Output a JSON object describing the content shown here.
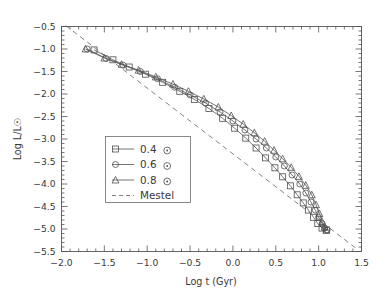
{
  "chart_data": {
    "type": "line",
    "title": "",
    "xlabel": "Log t (Gyr)",
    "ylabel": "Log L/L☉",
    "xlim": [
      -2.0,
      1.5
    ],
    "ylim": [
      -5.5,
      -0.5
    ],
    "xticks": [
      -2.0,
      -1.5,
      -1.0,
      -0.5,
      0.0,
      0.5,
      1.0,
      1.5
    ],
    "xtick_labels": [
      "-2.0",
      "-1.5",
      "-1.0",
      "-0.5",
      "0.0",
      "0.5",
      "1.0",
      "1.5"
    ],
    "yticks": [
      -0.5,
      -1.0,
      -1.5,
      -2.0,
      -2.5,
      -3.0,
      -3.5,
      -4.0,
      -4.5,
      -5.0,
      -5.5
    ],
    "ytick_labels": [
      "-0.5",
      "-1.0",
      "-1.5",
      "-2.0",
      "-2.5",
      "-3.0",
      "-3.5",
      "-4.0",
      "-4.5",
      "-5.0",
      "-5.5"
    ],
    "grid": false,
    "minor_ticks": true,
    "legend_position": "center-left",
    "series": [
      {
        "name": "0.4",
        "label": "0.4",
        "unit_symbol": "☉",
        "marker": "square",
        "linestyle": "solid",
        "color": "#5c5c5c",
        "points": [
          [
            -1.62,
            -1.02
          ],
          [
            -1.4,
            -1.24
          ],
          [
            -1.21,
            -1.4
          ],
          [
            -1.02,
            -1.56
          ],
          [
            -0.82,
            -1.74
          ],
          [
            -0.62,
            -1.94
          ],
          [
            -0.45,
            -2.12
          ],
          [
            -0.28,
            -2.32
          ],
          [
            -0.12,
            -2.54
          ],
          [
            0.02,
            -2.76
          ],
          [
            0.15,
            -2.98
          ],
          [
            0.27,
            -3.2
          ],
          [
            0.38,
            -3.42
          ],
          [
            0.49,
            -3.64
          ],
          [
            0.58,
            -3.84
          ],
          [
            0.67,
            -4.04
          ],
          [
            0.75,
            -4.24
          ],
          [
            0.82,
            -4.42
          ],
          [
            0.88,
            -4.58
          ],
          [
            0.94,
            -4.74
          ],
          [
            0.99,
            -4.88
          ],
          [
            1.04,
            -4.98
          ],
          [
            1.09,
            -5.02
          ]
        ]
      },
      {
        "name": "0.6",
        "label": "0.6",
        "unit_symbol": "☉",
        "marker": "circle",
        "linestyle": "solid",
        "color": "#5c5c5c",
        "points": [
          [
            -1.7,
            -1.0
          ],
          [
            -1.48,
            -1.21
          ],
          [
            -1.28,
            -1.36
          ],
          [
            -1.08,
            -1.5
          ],
          [
            -0.88,
            -1.66
          ],
          [
            -0.68,
            -1.85
          ],
          [
            -0.5,
            -2.02
          ],
          [
            -0.32,
            -2.2
          ],
          [
            -0.15,
            -2.4
          ],
          [
            0.0,
            -2.6
          ],
          [
            0.14,
            -2.8
          ],
          [
            0.27,
            -3.0
          ],
          [
            0.39,
            -3.2
          ],
          [
            0.5,
            -3.4
          ],
          [
            0.6,
            -3.6
          ],
          [
            0.69,
            -3.8
          ],
          [
            0.78,
            -4.0
          ],
          [
            0.85,
            -4.2
          ],
          [
            0.91,
            -4.4
          ],
          [
            0.96,
            -4.58
          ],
          [
            1.0,
            -4.74
          ],
          [
            1.04,
            -4.88
          ],
          [
            1.07,
            -4.98
          ],
          [
            1.1,
            -5.02
          ]
        ]
      },
      {
        "name": "0.8",
        "label": "0.8",
        "unit_symbol": "☉",
        "marker": "triangle",
        "linestyle": "solid",
        "color": "#5c5c5c",
        "points": [
          [
            -1.72,
            -1.0
          ],
          [
            -1.5,
            -1.2
          ],
          [
            -1.3,
            -1.34
          ],
          [
            -1.1,
            -1.47
          ],
          [
            -0.9,
            -1.62
          ],
          [
            -0.7,
            -1.78
          ],
          [
            -0.52,
            -1.94
          ],
          [
            -0.34,
            -2.11
          ],
          [
            -0.17,
            -2.29
          ],
          [
            -0.02,
            -2.48
          ],
          [
            0.12,
            -2.67
          ],
          [
            0.25,
            -2.86
          ],
          [
            0.37,
            -3.05
          ],
          [
            0.48,
            -3.25
          ],
          [
            0.58,
            -3.44
          ],
          [
            0.68,
            -3.63
          ],
          [
            0.77,
            -3.83
          ],
          [
            0.85,
            -4.03
          ],
          [
            0.92,
            -4.24
          ],
          [
            0.97,
            -4.46
          ],
          [
            1.01,
            -4.66
          ],
          [
            1.04,
            -4.84
          ],
          [
            1.07,
            -4.96
          ],
          [
            1.09,
            -5.03
          ]
        ]
      },
      {
        "name": "Mestel",
        "label": "Mestel",
        "marker": "none",
        "linestyle": "dashed",
        "color": "#6a6a6a",
        "points": [
          [
            -1.95,
            -0.48
          ],
          [
            1.45,
            -5.45
          ]
        ]
      }
    ],
    "legend_entries": [
      {
        "label": "0.4",
        "unit_symbol": "☉",
        "marker": "square",
        "linestyle": "solid"
      },
      {
        "label": "0.6",
        "unit_symbol": "☉",
        "marker": "circle",
        "linestyle": "solid"
      },
      {
        "label": "0.8",
        "unit_symbol": "☉",
        "marker": "triangle",
        "linestyle": "solid"
      },
      {
        "label": "Mestel",
        "unit_symbol": "",
        "marker": "none",
        "linestyle": "dashed"
      }
    ],
    "colors": {
      "background": "#ffffff",
      "axis": "#555555",
      "curve": "#5c5c5c",
      "dashed": "#6a6a6a",
      "text": "#3a3a3a"
    }
  }
}
